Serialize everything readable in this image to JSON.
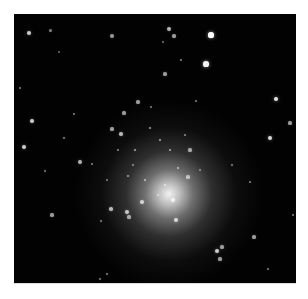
{
  "image": {
    "subject": "globular star cluster",
    "background_color": "#020202",
    "core_center": [
      153,
      162
    ],
    "stars": [
      [
        29,
        33,
        2.2,
        0.8
      ],
      [
        50,
        30,
        1.5,
        0.5
      ],
      [
        112,
        36,
        2,
        0.6
      ],
      [
        169,
        29,
        2,
        0.7
      ],
      [
        174,
        36,
        1.6,
        0.6
      ],
      [
        211,
        35,
        2.6,
        1
      ],
      [
        206,
        64,
        2.6,
        0.95
      ],
      [
        181,
        60,
        1.4,
        0.5
      ],
      [
        165,
        74,
        1.6,
        0.6
      ],
      [
        276,
        99,
        2.4,
        0.9
      ],
      [
        32,
        121,
        2,
        0.8
      ],
      [
        24,
        147,
        2,
        0.8
      ],
      [
        270,
        138,
        2.2,
        0.85
      ],
      [
        290,
        123,
        1.6,
        0.6
      ],
      [
        80,
        162,
        2,
        0.7
      ],
      [
        92,
        164,
        1.4,
        0.5
      ],
      [
        45,
        171,
        1.4,
        0.5
      ],
      [
        138,
        102,
        1.6,
        0.6
      ],
      [
        151,
        107,
        1.4,
        0.5
      ],
      [
        124,
        113,
        1.6,
        0.6
      ],
      [
        112,
        129,
        1.6,
        0.6
      ],
      [
        64,
        138,
        1.4,
        0.5
      ],
      [
        121,
        134,
        1.8,
        0.7
      ],
      [
        190,
        150,
        1.6,
        0.6
      ],
      [
        188,
        177,
        1.6,
        0.6
      ],
      [
        173,
        200,
        1.8,
        0.7
      ],
      [
        142,
        202,
        1.8,
        0.7
      ],
      [
        111,
        209,
        1.8,
        0.7
      ],
      [
        127,
        212,
        2,
        0.75
      ],
      [
        129,
        217,
        1.6,
        0.6
      ],
      [
        176,
        220,
        2,
        0.75
      ],
      [
        52,
        215,
        1.6,
        0.6
      ],
      [
        101,
        221,
        1.4,
        0.5
      ],
      [
        217,
        251,
        2,
        0.8
      ],
      [
        222,
        247,
        1.6,
        0.6
      ],
      [
        220,
        259,
        1.6,
        0.6
      ],
      [
        254,
        237,
        1.6,
        0.6
      ],
      [
        268,
        269,
        1.4,
        0.5
      ],
      [
        107,
        274,
        1.4,
        0.5
      ],
      [
        100,
        279,
        1.4,
        0.5
      ],
      [
        293,
        215,
        1.4,
        0.5
      ],
      [
        250,
        182,
        1.4,
        0.5
      ],
      [
        232,
        165,
        1.4,
        0.5
      ],
      [
        20,
        88,
        1.4,
        0.5
      ],
      [
        74,
        114,
        1.4,
        0.5
      ],
      [
        59,
        52,
        1.2,
        0.4
      ],
      [
        163,
        42,
        1.2,
        0.45
      ],
      [
        196,
        101,
        1.4,
        0.5
      ],
      [
        133,
        165,
        1.2,
        0.5
      ],
      [
        170,
        150,
        1.4,
        0.6
      ],
      [
        160,
        140,
        1.4,
        0.6
      ],
      [
        145,
        180,
        1.4,
        0.6
      ],
      [
        165,
        185,
        1.4,
        0.6
      ],
      [
        135,
        150,
        1.4,
        0.6
      ],
      [
        178,
        168,
        1.4,
        0.6
      ],
      [
        128,
        176,
        1.4,
        0.55
      ],
      [
        150,
        128,
        1.4,
        0.6
      ],
      [
        118,
        150,
        1.2,
        0.5
      ],
      [
        185,
        135,
        1.2,
        0.5
      ],
      [
        200,
        170,
        1.2,
        0.45
      ],
      [
        107,
        180,
        1.2,
        0.45
      ],
      [
        158,
        195,
        1.2,
        0.5
      ]
    ]
  }
}
